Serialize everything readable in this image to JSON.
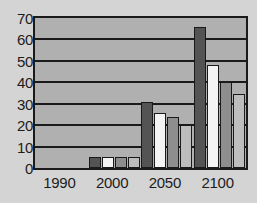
{
  "chart_data": {
    "type": "bar",
    "title": "",
    "subtitle": "",
    "xlabel": "",
    "ylabel": "",
    "categories": [
      "1990",
      "2000",
      "2050",
      "2100"
    ],
    "ylim": [
      0,
      70
    ],
    "yticks": [
      0,
      10,
      20,
      30,
      40,
      50,
      60,
      70
    ],
    "ytick_labels": [
      "0",
      "10",
      "20",
      "30",
      "40",
      "50",
      "60",
      "70"
    ],
    "grid": true,
    "grid_axis": "y",
    "legend": false,
    "legend_position": "none",
    "series": [
      {
        "name": "series-1",
        "color": "#545454",
        "values": [
          0,
          5,
          31,
          66
        ]
      },
      {
        "name": "series-2",
        "color": "#f4f4f4",
        "values": [
          0,
          5,
          25.5,
          48
        ]
      },
      {
        "name": "series-3",
        "color": "#8e8e8e",
        "values": [
          0,
          5,
          24,
          40
        ]
      },
      {
        "name": "series-4",
        "color": "#bdbdbd",
        "values": [
          0,
          5,
          20,
          34.5
        ]
      }
    ]
  },
  "style": {
    "page_background": "#d4d4d4",
    "plot_background": "#b0b0b0",
    "axis_color": "#1a1a1a",
    "tick_label_color": "#1c1c1c"
  }
}
